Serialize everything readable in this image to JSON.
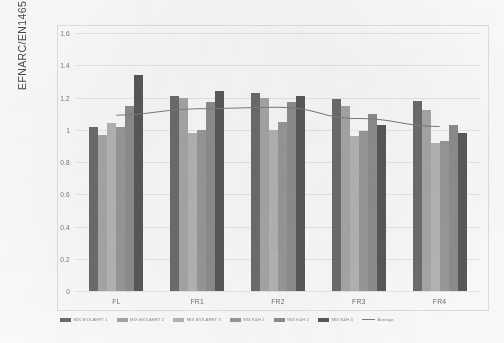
{
  "chart_data": {
    "type": "bar",
    "title": "",
    "xlabel": "",
    "ylabel": "EFNARC/EN14651",
    "ylim": [
      0,
      1.6
    ],
    "ytick_values": [
      0,
      0.2,
      0.4,
      0.6,
      0.8,
      1,
      1.2,
      1.4,
      1.6
    ],
    "ytick_labels": [
      "0",
      "0.2",
      "0.4",
      "0.6",
      "0.8",
      "1",
      "1.2",
      "1.4",
      "1.6"
    ],
    "grid": true,
    "legend_position": "bottom",
    "categories": [
      "FL",
      "FR1",
      "FR2",
      "FR3",
      "FR4"
    ],
    "series": [
      {
        "name": "MIX BIOLAERT 1",
        "color": "#6e6e6e",
        "values": [
          1.02,
          1.21,
          1.23,
          1.19,
          1.18
        ]
      },
      {
        "name": "MIX BIOLAERT 2",
        "color": "#a8a8a8",
        "values": [
          0.97,
          1.2,
          1.2,
          1.15,
          1.12
        ]
      },
      {
        "name": "MIX BIOLAERT 3",
        "color": "#b6b6b6",
        "values": [
          1.04,
          0.98,
          1.0,
          0.96,
          0.92
        ]
      },
      {
        "name": "MIX K&H 1",
        "color": "#9a9a9a",
        "values": [
          1.02,
          1.0,
          1.05,
          0.99,
          0.93
        ]
      },
      {
        "name": "MIX K&H 2",
        "color": "#8f8f8f",
        "values": [
          1.15,
          1.17,
          1.17,
          1.1,
          1.03
        ]
      },
      {
        "name": "MIX K&H 3",
        "color": "#5a5a5a",
        "values": [
          1.34,
          1.24,
          1.21,
          1.03,
          0.98
        ]
      }
    ],
    "average_line": {
      "name": "Average",
      "color": "#7e7e7e",
      "values": [
        1.09,
        1.13,
        1.14,
        1.07,
        1.02
      ]
    }
  },
  "legend": {
    "entries": [
      {
        "label": "MIX BIOLAERT 1",
        "color": "#6e6e6e",
        "marker": "swatch"
      },
      {
        "label": "MIX BIOLAERT 2",
        "color": "#a8a8a8",
        "marker": "swatch"
      },
      {
        "label": "MIX BIOLAERT 3",
        "color": "#b6b6b6",
        "marker": "swatch"
      },
      {
        "label": "MIX K&H 1",
        "color": "#9a9a9a",
        "marker": "swatch"
      },
      {
        "label": "MIX K&H 2",
        "color": "#8f8f8f",
        "marker": "swatch"
      },
      {
        "label": "MIX K&H 3",
        "color": "#5a5a5a",
        "marker": "swatch"
      },
      {
        "label": "Average",
        "color": "#7e7e7e",
        "marker": "line"
      }
    ]
  }
}
